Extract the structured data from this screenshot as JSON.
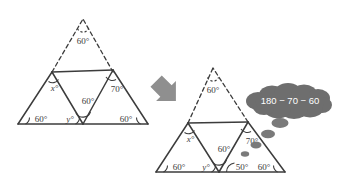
{
  "figure": {
    "colors": {
      "line": "#3c3c3c",
      "label": "#3c3c3c",
      "arrow": "#8c8c8c",
      "bubble": "#6e6e6e",
      "bubble_text": "#ffffff",
      "background": "#ffffff"
    }
  },
  "left_diagram": {
    "name": "before",
    "labels": {
      "apex": "60°",
      "upper_left_x": "x°",
      "upper_right": "70°",
      "inner_top": "60°",
      "base_left": "60°",
      "base_mid_y": "y°",
      "base_right": "60°"
    }
  },
  "right_diagram": {
    "name": "after",
    "labels": {
      "apex": "60°",
      "upper_left_x": "x°",
      "upper_right": "70°",
      "inner_top": "60°",
      "base_left": "60°",
      "base_mid_y": "y°",
      "base_mid_new": "50°",
      "base_right": "60°"
    }
  },
  "arrow": {
    "direction": "down-right",
    "name": "transition-arrow"
  },
  "thought_bubble": {
    "text": "180 − 70 − 60"
  }
}
